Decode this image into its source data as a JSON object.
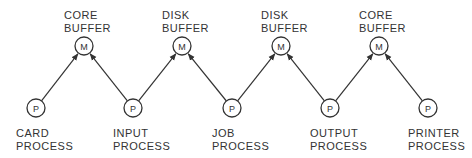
{
  "diagram": {
    "type": "process-buffer-chain",
    "colors": {
      "stroke": "#333333",
      "text": "#333333",
      "background": "#ffffff"
    },
    "buffers": [
      {
        "id": "m1",
        "symbol": "M",
        "label_line1": "CORE",
        "label_line2": "BUFFER",
        "cx": 84,
        "cy": 46
      },
      {
        "id": "m2",
        "symbol": "M",
        "label_line1": "DISK",
        "label_line2": "BUFFER",
        "cx": 182,
        "cy": 46
      },
      {
        "id": "m3",
        "symbol": "M",
        "label_line1": "DISK",
        "label_line2": "BUFFER",
        "cx": 281,
        "cy": 46
      },
      {
        "id": "m4",
        "symbol": "M",
        "label_line1": "CORE",
        "label_line2": "BUFFER",
        "cx": 379,
        "cy": 46
      }
    ],
    "processes": [
      {
        "id": "p1",
        "symbol": "P",
        "label_line1": "CARD",
        "label_line2": "PROCESS",
        "cx": 36,
        "cy": 108
      },
      {
        "id": "p2",
        "symbol": "P",
        "label_line1": "INPUT",
        "label_line2": "PROCESS",
        "cx": 133,
        "cy": 108
      },
      {
        "id": "p3",
        "symbol": "P",
        "label_line1": "JOB",
        "label_line2": "PROCESS",
        "cx": 232,
        "cy": 108
      },
      {
        "id": "p4",
        "symbol": "P",
        "label_line1": "OUTPUT",
        "label_line2": "PROCESS",
        "cx": 330,
        "cy": 108
      },
      {
        "id": "p5",
        "symbol": "P",
        "label_line1": "PRINTER",
        "label_line2": "PROCESS",
        "cx": 428,
        "cy": 108
      }
    ],
    "edges": [
      {
        "from": "p1",
        "to": "m1"
      },
      {
        "from": "p2",
        "to": "m1"
      },
      {
        "from": "p2",
        "to": "m2"
      },
      {
        "from": "p3",
        "to": "m2"
      },
      {
        "from": "p3",
        "to": "m3"
      },
      {
        "from": "p4",
        "to": "m3"
      },
      {
        "from": "p4",
        "to": "m4"
      },
      {
        "from": "p5",
        "to": "m4"
      }
    ]
  }
}
